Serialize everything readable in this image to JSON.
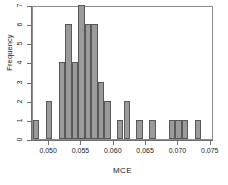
{
  "chart_data": {
    "type": "bar",
    "title": "",
    "subtitle": "",
    "xlabel": "MCE",
    "ylabel": "Frequency",
    "xlim": [
      0.0475,
      0.0755
    ],
    "ylim": [
      0,
      7
    ],
    "grid": false,
    "legend": null,
    "bin_width": 0.001,
    "xticks": [
      0.05,
      0.055,
      0.06,
      0.065,
      0.07,
      0.075
    ],
    "xtick_labels": [
      "0.050",
      "0.055",
      "0.060",
      "0.065",
      "0.070",
      "0.075"
    ],
    "yticks": [
      0,
      1,
      2,
      3,
      4,
      5,
      6,
      7
    ],
    "ytick_labels": [
      "0",
      "1",
      "2",
      "3",
      "4",
      "5",
      "6",
      "7"
    ],
    "bin_edges": [
      0.0475,
      0.0485,
      0.0495,
      0.0505,
      0.0515,
      0.0525,
      0.0535,
      0.0545,
      0.0555,
      0.0565,
      0.0575,
      0.0585,
      0.0595,
      0.0605,
      0.0615,
      0.0625,
      0.0635,
      0.0645,
      0.0655,
      0.0665,
      0.0675,
      0.0685,
      0.0695,
      0.0705,
      0.0715,
      0.0725,
      0.0735,
      0.0745,
      0.0755
    ],
    "categories": [
      "0.0480",
      "0.0490",
      "0.0500",
      "0.0510",
      "0.0520",
      "0.0530",
      "0.0540",
      "0.0550",
      "0.0560",
      "0.0570",
      "0.0580",
      "0.0590",
      "0.0600",
      "0.0610",
      "0.0620",
      "0.0630",
      "0.0640",
      "0.0650",
      "0.0660",
      "0.0670",
      "0.0680",
      "0.0690",
      "0.0700",
      "0.0710",
      "0.0720",
      "0.0730",
      "0.0740",
      "0.0750"
    ],
    "values": [
      1,
      0,
      2,
      0,
      4,
      6,
      4,
      7,
      6,
      6,
      3,
      2,
      0,
      1,
      2,
      0,
      1,
      0,
      1,
      0,
      0,
      1,
      1,
      1,
      0,
      1,
      0,
      0
    ],
    "bar_color": "#9a9a9a",
    "bar_border_color": "#595959",
    "frame_color": "#8c8c8c",
    "axis_color": "#6e6e6e",
    "background_color": "#ffffff"
  }
}
